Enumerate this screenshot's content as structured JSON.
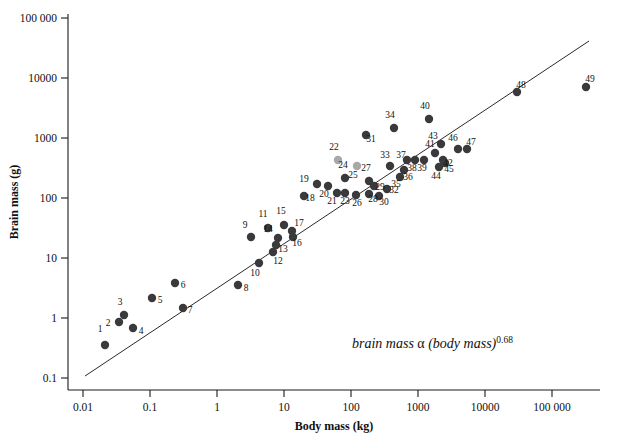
{
  "chart_data": {
    "type": "scatter",
    "title": "",
    "xlabel": "Body mass (kg)",
    "ylabel": "Brain mass (g)",
    "xscale": "log",
    "yscale": "log",
    "xlim": [
      0.0032,
      320000
    ],
    "ylim": [
      0.056,
      320000
    ],
    "xticks": [
      0.01,
      0.1,
      1,
      10,
      100,
      1000,
      10000,
      100000
    ],
    "xticklabels": [
      "0.01",
      "0.1",
      "1",
      "10",
      "100",
      "1000",
      "10000",
      "100 000"
    ],
    "yticks": [
      0.1,
      1,
      10,
      100,
      1000,
      10000,
      100000
    ],
    "yticklabels": [
      "0.1",
      "1",
      "10",
      "100",
      "1000",
      "10000",
      "100 000"
    ],
    "grid": false,
    "legend": null,
    "annotations": [
      {
        "name": "allometry-equation",
        "text_main": "brain mass",
        "text_alpha": "α",
        "text_paren": "(body mass)",
        "text_exponent": "0.68",
        "x": 0.72,
        "y": 0.18
      }
    ],
    "fit_line": {
      "name": "allometric-regression-line",
      "exponent": 0.68,
      "x_start": 0.016,
      "y_start": 0.145,
      "x_end": 240000,
      "y_end": 32000
    },
    "points": [
      {
        "label": "1",
        "x": 0.019,
        "y": 0.37,
        "color": "dark"
      },
      {
        "label": "2",
        "x": 0.031,
        "y": 0.84,
        "color": "dark"
      },
      {
        "label": "3",
        "x": 0.036,
        "y": 1.05,
        "color": "dark"
      },
      {
        "label": "4",
        "x": 0.047,
        "y": 0.7,
        "color": "dark"
      },
      {
        "label": "5",
        "x": 0.086,
        "y": 2.3,
        "color": "dark"
      },
      {
        "label": "6",
        "x": 0.19,
        "y": 4.1,
        "color": "dark"
      },
      {
        "label": "7",
        "x": 0.22,
        "y": 1.9,
        "color": "dark"
      },
      {
        "label": "8",
        "x": 1.2,
        "y": 3.0,
        "color": "dark"
      },
      {
        "label": "9",
        "x": 2.2,
        "y": 26,
        "color": "dark"
      },
      {
        "label": "10",
        "x": 2.5,
        "y": 9.5,
        "color": "dark"
      },
      {
        "label": "11",
        "x": 2.9,
        "y": 39,
        "color": "dark"
      },
      {
        "label": "12",
        "x": 3.4,
        "y": 15,
        "color": "dark"
      },
      {
        "label": "13",
        "x": 3.5,
        "y": 19,
        "color": "dark"
      },
      {
        "label": "14",
        "x": 3.8,
        "y": 25,
        "color": "dark"
      },
      {
        "label": "15",
        "x": 4.6,
        "y": 35,
        "color": "dark"
      },
      {
        "label": "16",
        "x": 6.5,
        "y": 25,
        "color": "dark"
      },
      {
        "label": "17",
        "x": 6.2,
        "y": 29,
        "color": "dark"
      },
      {
        "label": "18",
        "x": 10,
        "y": 110,
        "color": "dark"
      },
      {
        "label": "19",
        "x": 14,
        "y": 185,
        "color": "dark"
      },
      {
        "label": "20",
        "x": 23,
        "y": 175,
        "color": "dark"
      },
      {
        "label": "21",
        "x": 33,
        "y": 130,
        "color": "dark"
      },
      {
        "label": "22",
        "x": 34,
        "y": 630,
        "color": "gray"
      },
      {
        "label": "23",
        "x": 44,
        "y": 130,
        "color": "dark"
      },
      {
        "label": "24",
        "x": 44,
        "y": 245,
        "color": "dark"
      },
      {
        "label": "25",
        "x": 60,
        "y": 480,
        "color": "gray"
      },
      {
        "label": "26",
        "x": 58,
        "y": 120,
        "color": "dark"
      },
      {
        "label": "27",
        "x": 90,
        "y": 240,
        "color": "dark"
      },
      {
        "label": "28",
        "x": 93,
        "y": 120,
        "color": "dark"
      },
      {
        "label": "29",
        "x": 100,
        "y": 175,
        "color": "dark"
      },
      {
        "label": "30",
        "x": 115,
        "y": 105,
        "color": "dark"
      },
      {
        "label": "31",
        "x": 60,
        "y": 1250,
        "color": "dark"
      },
      {
        "label": "32",
        "x": 130,
        "y": 150,
        "color": "dark"
      },
      {
        "label": "33",
        "x": 140,
        "y": 260,
        "color": "dark"
      },
      {
        "label": "34",
        "x": 160,
        "y": 1700,
        "color": "dark"
      },
      {
        "label": "35",
        "x": 190,
        "y": 190,
        "color": "dark"
      },
      {
        "label": "36",
        "x": 220,
        "y": 230,
        "color": "dark"
      },
      {
        "label": "37",
        "x": 230,
        "y": 300,
        "color": "dark"
      },
      {
        "label": "38",
        "x": 300,
        "y": 300,
        "color": "dark"
      },
      {
        "label": "39",
        "x": 420,
        "y": 300,
        "color": "dark"
      },
      {
        "label": "40",
        "x": 510,
        "y": 2150,
        "color": "dark"
      },
      {
        "label": "41",
        "x": 570,
        "y": 380,
        "color": "dark"
      },
      {
        "label": "42",
        "x": 720,
        "y": 300,
        "color": "dark"
      },
      {
        "label": "43",
        "x": 640,
        "y": 530,
        "color": "dark"
      },
      {
        "label": "44",
        "x": 600,
        "y": 215,
        "color": "dark"
      },
      {
        "label": "45",
        "x": 740,
        "y": 250,
        "color": "dark"
      },
      {
        "label": "46",
        "x": 1350,
        "y": 450,
        "color": "dark"
      },
      {
        "label": "47",
        "x": 1950,
        "y": 450,
        "color": "dark"
      },
      {
        "label": "48",
        "x": 7500,
        "y": 5300,
        "color": "dark"
      },
      {
        "label": "49",
        "x": 66000,
        "y": 6900,
        "color": "dark"
      }
    ],
    "point_pixels": [
      {
        "label": "1",
        "px": 105,
        "py": 345,
        "lx": 100,
        "ly": 332
      },
      {
        "label": "2",
        "px": 119,
        "py": 322,
        "lx": 108,
        "ly": 326
      },
      {
        "label": "3",
        "px": 124,
        "py": 315,
        "lx": 120,
        "ly": 305
      },
      {
        "label": "4",
        "px": 133,
        "py": 328,
        "lx": 141,
        "ly": 334
      },
      {
        "label": "5",
        "px": 152,
        "py": 298,
        "lx": 160,
        "ly": 303
      },
      {
        "label": "6",
        "px": 175,
        "py": 283,
        "lx": 183,
        "ly": 288
      },
      {
        "label": "7",
        "px": 183,
        "py": 308,
        "lx": 190,
        "ly": 313
      },
      {
        "label": "8",
        "px": 238,
        "py": 285,
        "lx": 246,
        "ly": 291
      },
      {
        "label": "9",
        "px": 251,
        "py": 237,
        "lx": 245,
        "ly": 228
      },
      {
        "label": "10",
        "px": 259,
        "py": 263,
        "lx": 255,
        "ly": 276
      },
      {
        "label": "11",
        "px": 268,
        "py": 228,
        "lx": 263,
        "ly": 217
      },
      {
        "label": "12",
        "px": 273,
        "py": 252,
        "lx": 278,
        "ly": 264
      },
      {
        "label": "13",
        "px": 276,
        "py": 245,
        "lx": 283,
        "ly": 252
      },
      {
        "label": "14",
        "px": 278,
        "py": 238,
        "lx": 268,
        "ly": 232
      },
      {
        "label": "15",
        "px": 284,
        "py": 225,
        "lx": 281,
        "ly": 214
      },
      {
        "label": "16",
        "px": 293,
        "py": 237,
        "lx": 297,
        "ly": 246
      },
      {
        "label": "17",
        "px": 292,
        "py": 231,
        "lx": 299,
        "ly": 226
      },
      {
        "label": "18",
        "px": 304,
        "py": 196,
        "lx": 310,
        "ly": 201
      },
      {
        "label": "19",
        "px": 317,
        "py": 184,
        "lx": 304,
        "ly": 182
      },
      {
        "label": "20",
        "px": 328,
        "py": 186,
        "lx": 324,
        "ly": 197
      },
      {
        "label": "21",
        "px": 337,
        "py": 193,
        "lx": 332,
        "ly": 204
      },
      {
        "label": "22",
        "px": 338,
        "py": 160,
        "lx": 334,
        "ly": 150
      },
      {
        "label": "23",
        "px": 345,
        "py": 193,
        "lx": 345,
        "ly": 204
      },
      {
        "label": "24",
        "px": 345,
        "py": 178,
        "lx": 343,
        "ly": 168
      },
      {
        "label": "25",
        "px": 357,
        "py": 166,
        "lx": 353,
        "ly": 178
      },
      {
        "label": "26",
        "px": 356,
        "py": 195,
        "lx": 357,
        "ly": 206
      },
      {
        "label": "27",
        "px": 369,
        "py": 181,
        "lx": 366,
        "ly": 171
      },
      {
        "label": "28",
        "px": 369,
        "py": 194,
        "lx": 373,
        "ly": 202
      },
      {
        "label": "29",
        "px": 374,
        "py": 186,
        "lx": 380,
        "ly": 190
      },
      {
        "label": "30",
        "px": 379,
        "py": 196,
        "lx": 384,
        "ly": 205
      },
      {
        "label": "31",
        "px": 366,
        "py": 135,
        "lx": 371,
        "ly": 142
      },
      {
        "label": "32",
        "px": 387,
        "py": 189,
        "lx": 394,
        "ly": 193
      },
      {
        "label": "33",
        "px": 390,
        "py": 166,
        "lx": 385,
        "ly": 158
      },
      {
        "label": "34",
        "px": 394,
        "py": 128,
        "lx": 390,
        "ly": 118
      },
      {
        "label": "35",
        "px": 400,
        "py": 177,
        "lx": 396,
        "ly": 187
      },
      {
        "label": "36",
        "px": 404,
        "py": 170,
        "lx": 408,
        "ly": 180
      },
      {
        "label": "37",
        "px": 407,
        "py": 160,
        "lx": 401,
        "ly": 158
      },
      {
        "label": "38",
        "px": 415,
        "py": 160,
        "lx": 412,
        "ly": 171
      },
      {
        "label": "39",
        "px": 424,
        "py": 160,
        "lx": 422,
        "ly": 171
      },
      {
        "label": "40",
        "px": 429,
        "py": 119,
        "lx": 425,
        "ly": 109
      },
      {
        "label": "41",
        "px": 435,
        "py": 153,
        "lx": 430,
        "ly": 147
      },
      {
        "label": "42",
        "px": 443,
        "py": 160,
        "lx": 448,
        "ly": 166
      },
      {
        "label": "43",
        "px": 441,
        "py": 144,
        "lx": 433,
        "ly": 139
      },
      {
        "label": "44",
        "px": 439,
        "py": 167,
        "lx": 436,
        "ly": 179
      },
      {
        "label": "45",
        "px": 445,
        "py": 163,
        "lx": 449,
        "ly": 172
      },
      {
        "label": "46",
        "px": 458,
        "py": 149,
        "lx": 453,
        "ly": 141
      },
      {
        "label": "47",
        "px": 467,
        "py": 149,
        "lx": 471,
        "ly": 145
      },
      {
        "label": "48",
        "px": 517,
        "py": 92,
        "lx": 521,
        "ly": 88
      },
      {
        "label": "49",
        "px": 586,
        "py": 87,
        "lx": 590,
        "ly": 82
      }
    ]
  },
  "axes": {
    "x_title": "Body mass (kg)",
    "y_title": "Brain mass (g)",
    "x_ticks": [
      {
        "value": "0.01",
        "px": 83
      },
      {
        "value": "0.1",
        "px": 150
      },
      {
        "value": "1",
        "px": 217
      },
      {
        "value": "10",
        "px": 284
      },
      {
        "value": "100",
        "px": 351
      },
      {
        "value": "1000",
        "px": 418
      },
      {
        "value": "10000",
        "px": 485
      },
      {
        "value": "100 000",
        "px": 552
      }
    ],
    "y_ticks": [
      {
        "value": "100 000",
        "py": 18
      },
      {
        "value": "10000",
        "py": 78
      },
      {
        "value": "1000",
        "py": 138
      },
      {
        "value": "100",
        "py": 198
      },
      {
        "value": "10",
        "py": 258
      },
      {
        "value": "1",
        "py": 318
      },
      {
        "value": "0.1",
        "py": 378
      }
    ]
  },
  "equation": {
    "main": "brain mass",
    "alpha": "α",
    "paren": "(body mass)",
    "exponent": "0.68"
  },
  "colors": {
    "point_dark": "#3a3a3c",
    "point_gray": "#a8a8a8",
    "axis": "#1a1a1a",
    "line": "#2b2b2b",
    "background": "#ffffff"
  }
}
